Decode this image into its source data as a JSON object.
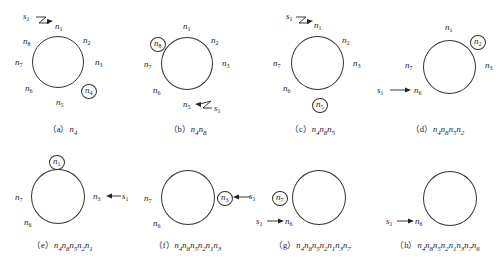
{
  "figure": {
    "source_label": "s1",
    "panels": [
      {
        "id": "a",
        "caption_tag": "（a）",
        "caption_seq": "n4",
        "visible_nodes": [
          "n1",
          "n2",
          "n3",
          "n4",
          "n5",
          "n6",
          "n7",
          "n8"
        ],
        "highlighted": "n4",
        "source_target": "n1",
        "arrow_style": "zigzag"
      },
      {
        "id": "b",
        "caption_tag": "（b）",
        "caption_seq": "n4n8",
        "visible_nodes": [
          "n1",
          "n2",
          "n3",
          "n5",
          "n6",
          "n7",
          "n8"
        ],
        "highlighted": "n8",
        "source_target": "n5",
        "arrow_style": "zigzag"
      },
      {
        "id": "c",
        "caption_tag": "（c）",
        "caption_seq": "n4n8n5",
        "visible_nodes": [
          "n1",
          "n2",
          "n3",
          "n5",
          "n6",
          "n7"
        ],
        "highlighted": "n5",
        "source_target": "n1",
        "arrow_style": "zigzag"
      },
      {
        "id": "d",
        "caption_tag": "（d）",
        "caption_seq": "n4n8n5n2",
        "visible_nodes": [
          "n1",
          "n2",
          "n3",
          "n6",
          "n7"
        ],
        "highlighted": "n2",
        "source_target": "n6",
        "arrow_style": "straight"
      },
      {
        "id": "e",
        "caption_tag": "（e）",
        "caption_seq": "n4n8n5n2n1",
        "visible_nodes": [
          "n1",
          "n3",
          "n6",
          "n7"
        ],
        "highlighted": "n1",
        "source_target": "n3",
        "arrow_style": "straight"
      },
      {
        "id": "f",
        "caption_tag": "（f）",
        "caption_seq": "n4n8n5n2n1n3",
        "visible_nodes": [
          "n3",
          "n6",
          "n7"
        ],
        "highlighted": "n3",
        "source_target": "n3",
        "arrow_style": "straight"
      },
      {
        "id": "g",
        "caption_tag": "（g）",
        "caption_seq": "n4n8n5n2n1n3n7",
        "visible_nodes": [
          "n6",
          "n7"
        ],
        "highlighted": "n7",
        "source_target": "n6",
        "arrow_style": "straight"
      },
      {
        "id": "h",
        "caption_tag": "（h）",
        "caption_seq": "n4n8n5n2n1n3n7n6",
        "visible_nodes": [
          "n6"
        ],
        "highlighted": null,
        "source_target": "n6",
        "arrow_style": "straight"
      }
    ]
  },
  "labels": {
    "n1": "n",
    "n1_sub": "1",
    "n2": "n",
    "n2_sub": "2",
    "n3": "n",
    "n3_sub": "3",
    "n4": "n",
    "n4_sub": "4",
    "n5": "n",
    "n5_sub": "5",
    "n6": "n",
    "n6_sub": "6",
    "n7": "n",
    "n7_sub": "7",
    "n8": "n",
    "n8_sub": "8",
    "s": "s",
    "s_sub": "1"
  },
  "captions": {
    "a": {
      "tag": "（a）",
      "seq": "n",
      "subs": [
        "4"
      ]
    },
    "b": {
      "tag": "（b）",
      "seq": "n",
      "subs": [
        "4",
        "8"
      ]
    },
    "c": {
      "tag": "（c）",
      "seq": "n",
      "subs": [
        "4",
        "8",
        "5"
      ]
    },
    "d": {
      "tag": "（d）",
      "seq": "n",
      "subs": [
        "4",
        "8",
        "5",
        "2"
      ]
    },
    "e": {
      "tag": "（e）",
      "seq": "n",
      "subs": [
        "4",
        "8",
        "5",
        "2",
        "1"
      ]
    },
    "f": {
      "tag": "（f）",
      "seq": "n",
      "subs": [
        "4",
        "8",
        "5",
        "2",
        "1",
        "3"
      ]
    },
    "g": {
      "tag": "（g）",
      "seq": "n",
      "subs": [
        "4",
        "8",
        "5",
        "2",
        "1",
        "3",
        "7"
      ]
    },
    "h": {
      "tag": "（h）",
      "seq": "n",
      "subs": [
        "4",
        "8",
        "5",
        "2",
        "1",
        "3",
        "7",
        "6"
      ]
    }
  }
}
